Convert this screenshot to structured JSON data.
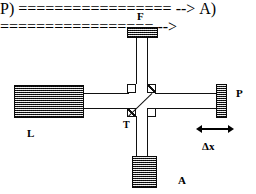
{
  "figure": {
    "type": "optical-interferometer-schematic",
    "background_color": "#ffffff",
    "line_color": "#111111",
    "block_fill_color": "#8e8e8e"
  },
  "labels": {
    "filter": "F",
    "laser": "L",
    "beam_splitter": "T",
    "mirror": "P",
    "detector": "A",
    "displacement": "Δx"
  },
  "components": [
    {
      "id": "F",
      "label": "F",
      "shape": "hatched-rectangle",
      "orientation": "horizontal",
      "position": "top"
    },
    {
      "id": "L",
      "label": "L",
      "shape": "hatched-rectangle",
      "orientation": "horizontal",
      "position": "left"
    },
    {
      "id": "P",
      "label": "P",
      "shape": "hatched-rectangle",
      "orientation": "vertical",
      "position": "right"
    },
    {
      "id": "A",
      "label": "A",
      "shape": "hatched-square",
      "orientation": "square",
      "position": "bottom"
    },
    {
      "id": "T",
      "label": "T",
      "shape": "diagonal-beam-splitter",
      "orientation": "diagonal",
      "position": "center"
    }
  ],
  "junction_pads": [
    {
      "id": "pad-top-left",
      "fill": "white"
    },
    {
      "id": "pad-top-right",
      "fill": "hatched"
    },
    {
      "id": "pad-bottom-left",
      "fill": "hatched"
    },
    {
      "id": "pad-bottom-right",
      "fill": "white"
    }
  ],
  "annotation": {
    "arrow": "double-headed-horizontal-arrow",
    "arrow_label": "Δx"
  }
}
